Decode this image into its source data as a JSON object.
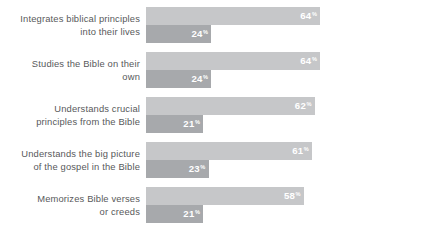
{
  "chart_data": {
    "type": "bar",
    "orientation": "horizontal",
    "title": "",
    "subtitle": "",
    "xlabel": "",
    "ylabel": "",
    "xlim": [
      0,
      100
    ],
    "grid": false,
    "legend": null,
    "value_suffix": "%",
    "categories": [
      "Integrates biblical principles\ninto their lives",
      "Studies the Bible on their\nown",
      "Understands crucial\nprinciples from the Bible",
      "Understands the big picture\nof the gospel in the Bible",
      "Memorizes Bible verses\nor creeds"
    ],
    "series": [
      {
        "name": "series-a",
        "color": "#c6c7c9",
        "values": [
          64,
          64,
          62,
          61,
          58
        ]
      },
      {
        "name": "series-b",
        "color": "#a7a9ac",
        "values": [
          24,
          24,
          21,
          23,
          21
        ]
      }
    ],
    "value_labels": {
      "series_a": [
        "64",
        "64",
        "62",
        "61",
        "58"
      ],
      "series_b": [
        "24",
        "24",
        "21",
        "23",
        "21"
      ]
    },
    "percent_sign": "%"
  },
  "style": {
    "background": "#ffffff",
    "label_color": "#58595b",
    "value_color": "#ffffff",
    "series_a_color": "#c6c7c9",
    "series_b_color": "#a7a9ac"
  }
}
